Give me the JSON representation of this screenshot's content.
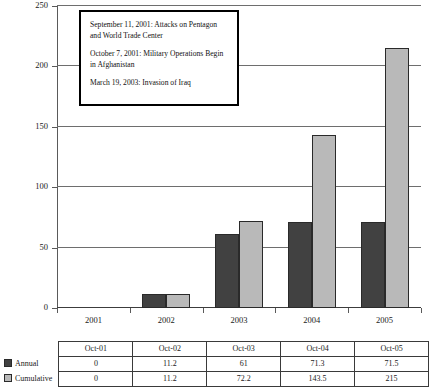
{
  "chart_data": {
    "type": "bar",
    "title": "",
    "xlabel": "",
    "ylabel": "",
    "categories": [
      "2001",
      "2002",
      "2003",
      "2004",
      "2005"
    ],
    "series": [
      {
        "name": "Annual",
        "values": [
          0,
          11.2,
          61,
          71.3,
          71.5
        ],
        "color": "#414141"
      },
      {
        "name": "Cumulative",
        "values": [
          0,
          11.2,
          72.2,
          143.5,
          215
        ],
        "color": "#b9b9b9"
      }
    ],
    "ylim": [
      0,
      250
    ],
    "yticks": [
      0,
      50,
      100,
      150,
      200,
      250
    ],
    "grid": true,
    "legend_position": "table-row-headers"
  },
  "annotation": {
    "events": [
      {
        "line1": "September 11, 2001: Attacks on  Pentagon",
        "line2": "and  World Trade Center"
      },
      {
        "line1": "October 7, 2001: Military Operations Begin",
        "line2": " in  Afghanistan"
      },
      {
        "line1": "March 19,  2003: Invasion of Iraq",
        "line2": ""
      }
    ]
  },
  "table": {
    "corner_label": "",
    "columns": [
      "Oct-01",
      "Oct-02",
      "Oct-03",
      "Oct-04",
      "Oct-05"
    ],
    "rows": [
      {
        "label": "Annual",
        "swatch_color": "#414141",
        "values": [
          "0",
          "11.2",
          "61",
          "71.3",
          "71.5"
        ]
      },
      {
        "label": "Cumulative",
        "swatch_color": "#b9b9b9",
        "values": [
          "0",
          "11.2",
          "72.2",
          "143.5",
          "215"
        ]
      }
    ]
  },
  "axis": {
    "y_labels": [
      "250",
      "200",
      "150",
      "100",
      "50",
      "0"
    ],
    "x_labels": [
      "2001",
      "2002",
      "2003",
      "2004",
      "2005"
    ]
  }
}
